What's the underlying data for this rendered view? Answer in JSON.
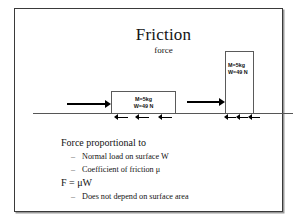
{
  "slide": {
    "title": "Friction",
    "subtitle": "force",
    "diagram": {
      "block_left": {
        "mass_label": "M=5kg",
        "weight_label": "W=49 N"
      },
      "block_right": {
        "mass_label": "M=5kg",
        "weight_label": "W=49 N"
      },
      "applied_force_arrow_left": "applied-force-arrow",
      "applied_force_arrow_right": "applied-force-arrow",
      "friction_arrows_left_count": 3,
      "friction_arrows_right_count": 3,
      "ground_line": "ground-surface-line"
    },
    "body": {
      "heading_1": "Force proportional to",
      "bullet_1": "Normal load on surface W",
      "bullet_2": "Coefficient of friction μ",
      "heading_2": "F = μW",
      "bullet_3": "Does not depend on surface area",
      "dash": "–"
    }
  },
  "colors": {
    "ink": "#131313",
    "frame": "#3a3a3a",
    "arrow": "#000000",
    "ground": "#565656"
  }
}
